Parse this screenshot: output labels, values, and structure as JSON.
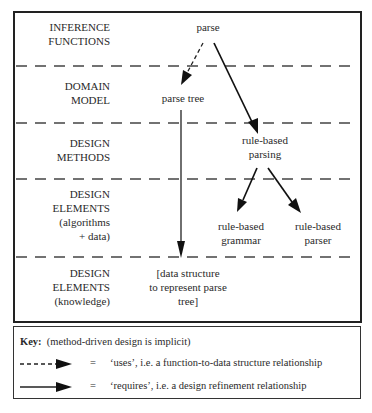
{
  "diagram": {
    "rows": [
      {
        "label_lines": [
          "INFERENCE",
          "FUNCTIONS"
        ]
      },
      {
        "label_lines": [
          "DOMAIN",
          "MODEL"
        ]
      },
      {
        "label_lines": [
          "DESIGN",
          "METHODS"
        ]
      },
      {
        "label_lines": [
          "DESIGN",
          "ELEMENTS",
          "(algorithms",
          "+ data)"
        ]
      },
      {
        "label_lines": [
          "DESIGN",
          "ELEMENTS",
          "(knowledge)"
        ]
      }
    ],
    "nodes": {
      "parse": {
        "lines": [
          "parse"
        ]
      },
      "parse_tree": {
        "lines": [
          "parse tree"
        ]
      },
      "rule_based_parsing": {
        "lines": [
          "rule-based",
          "parsing"
        ]
      },
      "rule_based_grammar": {
        "lines": [
          "rule-based",
          "grammar"
        ]
      },
      "rule_based_parser": {
        "lines": [
          "rule-based",
          "parser"
        ]
      },
      "data_structure": {
        "lines": [
          "[data structure",
          "to represent parse",
          "tree]"
        ]
      }
    },
    "edges": [
      {
        "from": "parse",
        "to": "parse_tree",
        "style": "dashed",
        "meaning": "uses"
      },
      {
        "from": "parse",
        "to": "rule_based_parsing",
        "style": "solid",
        "meaning": "requires"
      },
      {
        "from": "parse_tree",
        "to": "data_structure",
        "style": "solid",
        "meaning": "requires"
      },
      {
        "from": "rule_based_parsing",
        "to": "rule_based_grammar",
        "style": "solid",
        "meaning": "requires"
      },
      {
        "from": "rule_based_parsing",
        "to": "rule_based_parser",
        "style": "solid",
        "meaning": "requires"
      }
    ]
  },
  "key": {
    "title": "Key:",
    "note": "(method-driven design is implicit)",
    "items": [
      {
        "equals": "=",
        "text": "‘uses’,  i.e. a function-to-data structure relationship",
        "style": "dashed"
      },
      {
        "equals": "=",
        "text": "‘requires’,  i.e. a design refinement relationship",
        "style": "solid"
      }
    ]
  },
  "colors": {
    "line": "#222222",
    "text": "#2a2a2a",
    "dash": "#444444"
  }
}
